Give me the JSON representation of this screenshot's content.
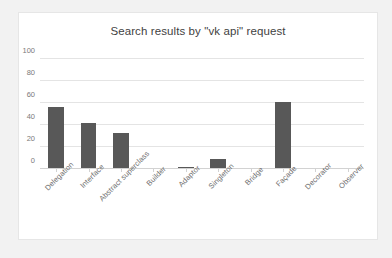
{
  "chart_data": {
    "type": "bar",
    "title": "Search results by \"vk api\" request",
    "xlabel": "",
    "ylabel": "",
    "ylim": [
      0,
      100
    ],
    "yticks": [
      0,
      20,
      40,
      60,
      80,
      100
    ],
    "grid": true,
    "legend": false,
    "bar_color": "#585858",
    "categories": [
      "Delegation",
      "Interface",
      "Abstract superclass",
      "Builder",
      "Adaptor",
      "Singleton",
      "Bridge",
      "Façade",
      "Decorator",
      "Observer"
    ],
    "values": [
      56,
      42,
      33,
      0,
      2,
      9,
      0,
      61,
      0,
      0
    ]
  }
}
